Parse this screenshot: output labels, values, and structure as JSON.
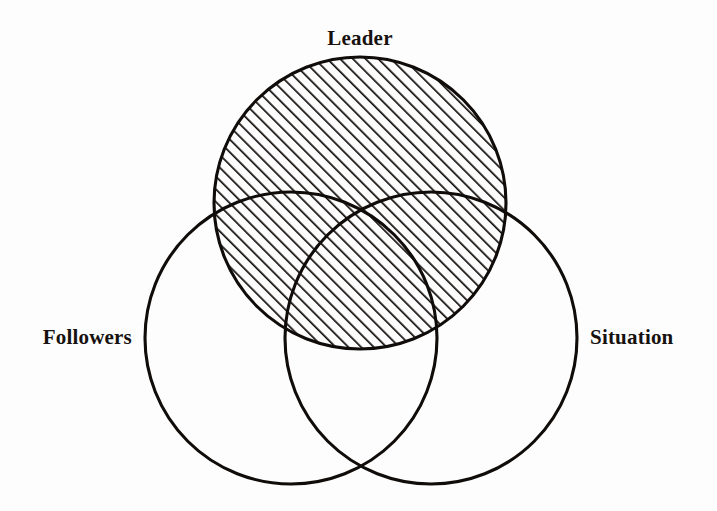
{
  "figure": {
    "type": "venn-diagram",
    "background_color": "#fdfdfd",
    "stroke_color": "#100c0a",
    "text_color": "#17120f",
    "labels": {
      "top": "Leader",
      "left": "Followers",
      "right": "Situation"
    },
    "circles": [
      {
        "id": "leader",
        "label": "Leader",
        "cx": 360,
        "cy": 203,
        "r": 146,
        "fill": "diagonal-hatch",
        "hatch_direction": "forward-slash",
        "hatch_spacing": 9,
        "hatch_line_width": 3.4
      },
      {
        "id": "followers",
        "label": "Followers",
        "cx": 291,
        "cy": 338,
        "r": 146,
        "fill": "none"
      },
      {
        "id": "situation",
        "label": "Situation",
        "cx": 431,
        "cy": 338,
        "r": 146,
        "fill": "none"
      }
    ],
    "label_positions": {
      "leader": {
        "x": 360,
        "y": 45,
        "anchor": "middle"
      },
      "followers": {
        "x": 132,
        "y": 344,
        "anchor": "end"
      },
      "situation": {
        "x": 590,
        "y": 344,
        "anchor": "start"
      }
    }
  }
}
